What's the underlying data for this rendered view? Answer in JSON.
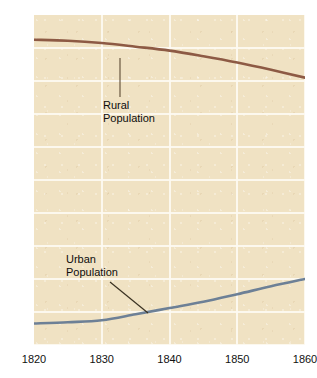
{
  "chart_data": {
    "type": "line",
    "title": "",
    "xlabel": "",
    "ylabel": "",
    "xlim": [
      1820,
      1860
    ],
    "ylim": [
      0,
      100
    ],
    "grid": true,
    "legend_position": "inline-annotations",
    "x": [
      1820,
      1825,
      1830,
      1835,
      1840,
      1845,
      1850,
      1855,
      1860
    ],
    "xticks": [
      "1820",
      "1830",
      "1840",
      "1850",
      "1860"
    ],
    "yticks": [
      "100%",
      "90",
      "80",
      "70",
      "60",
      "50",
      "40",
      "30",
      "20",
      "10",
      "0"
    ],
    "ytick_values": [
      100,
      90,
      80,
      70,
      60,
      50,
      40,
      30,
      20,
      10,
      0
    ],
    "series": [
      {
        "name": "Rural Population",
        "color": "#8d5a44",
        "values": [
          92.5,
          92.2,
          91.5,
          90.4,
          89.2,
          87.5,
          85.6,
          83.4,
          81.0
        ]
      },
      {
        "name": "Urban Population",
        "color": "#6d8096",
        "values": [
          6.5,
          6.9,
          7.5,
          9.3,
          11.2,
          13.1,
          15.4,
          17.8,
          20.0
        ]
      }
    ],
    "annotations": [
      {
        "text_line1": "Rural",
        "text_line2": "Population"
      },
      {
        "text_line1": "Urban",
        "text_line2": "Population"
      }
    ]
  },
  "colors": {
    "plot_background": "#f0e2c3",
    "gridline": "#fdfaf2",
    "rural_line": "#8d5a44",
    "urban_line": "#6d8096",
    "text": "#111111",
    "page_background": "#ffffff"
  },
  "axis": {
    "y_top_label": "100%",
    "y_labels": [
      "100%",
      "90",
      "80",
      "70",
      "60",
      "50",
      "40",
      "30",
      "20",
      "10",
      "0"
    ],
    "x_labels": [
      "1820",
      "1830",
      "1840",
      "1850",
      "1860"
    ]
  }
}
